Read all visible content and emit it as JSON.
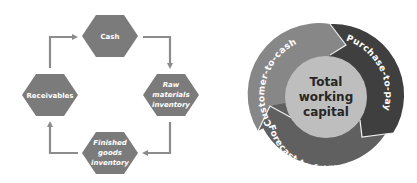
{
  "left_diagram": {
    "title": "Working capital cycle",
    "nodes": [
      {
        "id": "cash",
        "lines": [
          "Cash"
        ]
      },
      {
        "id": "raw",
        "lines": [
          "Raw",
          "materials",
          "inventory"
        ]
      },
      {
        "id": "finished",
        "lines": [
          "Finished",
          "goods",
          "inventory"
        ]
      },
      {
        "id": "receivables",
        "lines": [
          "Receivables"
        ]
      }
    ],
    "flow": [
      "Cash",
      "Raw materials inventory",
      "Finished goods inventory",
      "Receivables",
      "Cash"
    ]
  },
  "right_diagram": {
    "center": [
      "Total",
      "working",
      "capital"
    ],
    "segments": [
      {
        "label": "Customer-to-cash"
      },
      {
        "label": "Purchase-to-pay"
      },
      {
        "label": "Forecast-to-fulfil"
      }
    ]
  },
  "colors": {
    "hexagon": "#7b7b7b",
    "arrow": "#8c8c8c",
    "segment_customer": "#878787",
    "segment_purchase": "#3f3f3f",
    "segment_forecast": "#606060",
    "inner_circle": "#bebebe",
    "center_text": "#262626"
  }
}
